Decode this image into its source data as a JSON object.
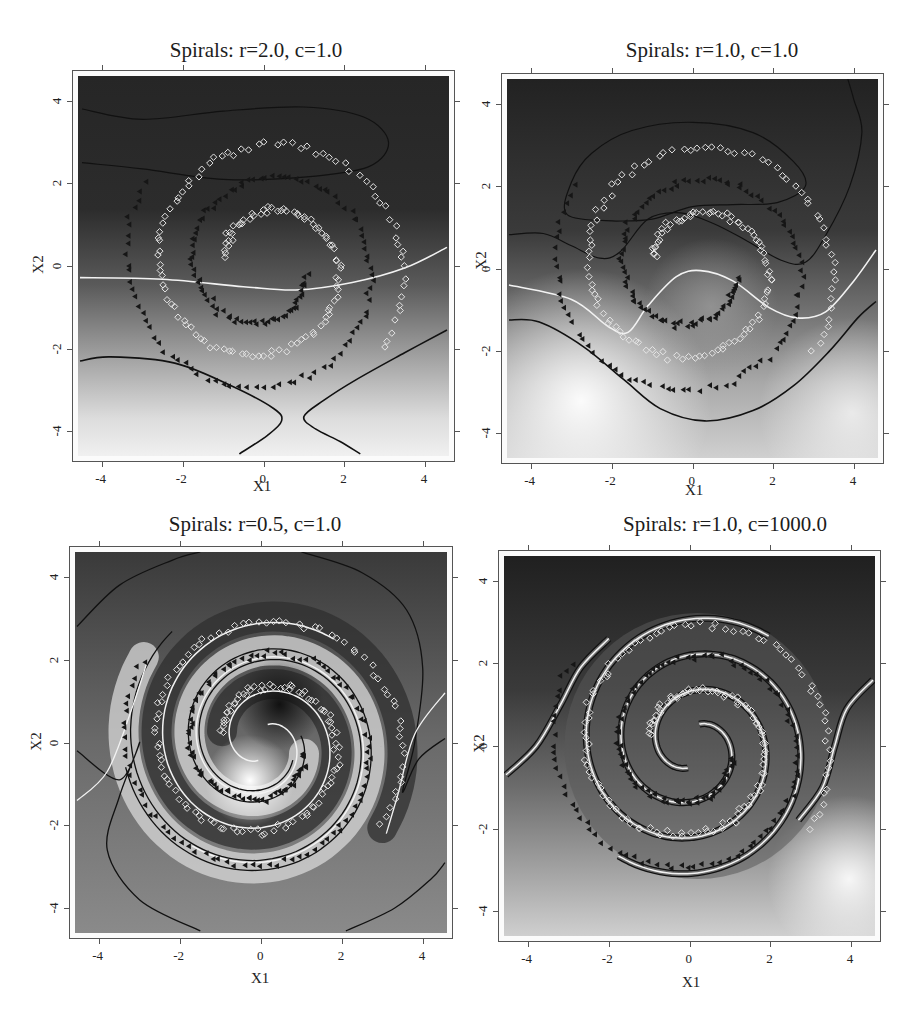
{
  "figure": {
    "layout": "2x2",
    "colors": {
      "surface_dark": "#232323",
      "surface_light": "#f4f4f4",
      "decision_contour": "#f2f2f2",
      "margin_contour": "#1a1a1a",
      "class1_marker": "#e6e6e6",
      "class2_marker": "#161616",
      "frame": "#555555"
    },
    "markers": {
      "class1": "hollow-diamond",
      "class2": "filled-left-triangle"
    }
  },
  "panels": [
    {
      "id": "p1",
      "title": "Spirals: r=2.0, c=1.0",
      "xlabel": "X1",
      "ylabel": "X2",
      "xticks": [
        "-4",
        "-2",
        "0",
        "2",
        "4"
      ],
      "yticks": [
        "-4",
        "-2",
        "0",
        "2",
        "4"
      ]
    },
    {
      "id": "p2",
      "title": "Spirals: r=1.0, c=1.0",
      "xlabel": "X1",
      "ylabel": "X2",
      "xticks": [
        "-4",
        "-2",
        "0",
        "2",
        "4"
      ],
      "yticks": [
        "-4",
        "-2",
        "0",
        "2",
        "4"
      ]
    },
    {
      "id": "p3",
      "title": "Spirals: r=0.5, c=1.0",
      "xlabel": "X1",
      "ylabel": "X2",
      "xticks": [
        "-4",
        "-2",
        "0",
        "2",
        "4"
      ],
      "yticks": [
        "-4",
        "-2",
        "0",
        "2",
        "4"
      ]
    },
    {
      "id": "p4",
      "title": "Spirals: r=1.0, c=1000.0",
      "xlabel": "X1",
      "ylabel": "X2",
      "xticks": [
        "-4",
        "-2",
        "0",
        "2",
        "4"
      ],
      "yticks": [
        "-4",
        "-2",
        "0",
        "2",
        "4"
      ]
    }
  ],
  "chart_data": [
    {
      "type": "contour",
      "title": "Spirals: r=2.0, c=1.0",
      "xlabel": "X1",
      "ylabel": "X2",
      "xlim": [
        -4.6,
        4.6
      ],
      "ylim": [
        -4.6,
        4.6
      ],
      "xticks": [
        -4,
        -2,
        0,
        2,
        4
      ],
      "yticks": [
        -4,
        -2,
        0,
        2,
        4
      ],
      "grid": false,
      "legend": null,
      "series": [
        {
          "name": "class 1 (spiral A)",
          "marker": "hollow-diamond",
          "color": "#e6e6e6",
          "spiral": {
            "r_start": 1.2,
            "r_end": 3.6,
            "theta_start_deg": 90,
            "theta_turn_deg": 360,
            "direction": "ccw"
          }
        },
        {
          "name": "class 2 (spiral B)",
          "marker": "filled-left-triangle",
          "color": "#161616",
          "spiral": {
            "r_start": 1.2,
            "r_end": 3.6,
            "theta_start_deg": 270,
            "theta_turn_deg": 360,
            "direction": "ccw"
          }
        }
      ],
      "contours": {
        "decision_f0": "nearly horizontal line from (-4.5,-0.25) dipping to (0.5,-0.55) rising to (4.5,0.45)",
        "margin_f_minus1": "two hyperbola-like arcs meeting near (0.7,-3.6)",
        "margin_f_plus1": "closed oval top region from x=-4.5 to 3.1, y 2.1 to 3.8"
      },
      "annotation": "smooth, underfits spiral; top dark, bottom light"
    },
    {
      "type": "contour",
      "title": "Spirals: r=1.0, c=1.0",
      "xlabel": "X1",
      "ylabel": "X2",
      "xlim": [
        -4.6,
        4.6
      ],
      "ylim": [
        -4.6,
        4.6
      ],
      "xticks": [
        -4,
        -2,
        0,
        2,
        4
      ],
      "yticks": [
        -4,
        -2,
        0,
        2,
        4
      ],
      "grid": false,
      "legend": null,
      "contours": {
        "decision_f0": "wavy line from (-4.5,-0.4) down to (-1.6,-1.55) up to (0.1,-0.05) down to (2.7,-1.2) up to (4.5,0.45)",
        "margin_f_minus1": "U-shaped curve from (-4.5,-1.25) down to (0.3,-3.7) up to (4.5,-0.8)",
        "margin_f_plus1": "arch region from (-4.5,0.8) over (0,3.6) to (4.1,4.6) with inner loop"
      },
      "annotation": "moderate fit; bottom-left lightest"
    },
    {
      "type": "contour",
      "title": "Spirals: r=0.5, c=1.0",
      "xlabel": "X1",
      "ylabel": "X2",
      "xlim": [
        -4.6,
        4.6
      ],
      "ylim": [
        -4.6,
        4.6
      ],
      "xticks": [
        -4,
        -2,
        0,
        2,
        4
      ],
      "yticks": [
        -4,
        -2,
        0,
        2,
        4
      ],
      "grid": false,
      "legend": null,
      "contours": {
        "decision_f0": "double spiral (yin-yang) separating the two classes",
        "margin_f_minus1": "spiral curve along class-2 points",
        "margin_f_plus1": "outer S-shaped contours at corners"
      },
      "annotation": "tight fit; dark blob near (0.5,0.8), light blob near (-0.3,-0.9)"
    },
    {
      "type": "contour",
      "title": "Spirals: r=1.0, c=1000.0",
      "xlabel": "X1",
      "ylabel": "X2",
      "xlim": [
        -4.6,
        4.6
      ],
      "ylim": [
        -4.6,
        4.6
      ],
      "xticks": [
        -4,
        -2,
        0,
        2,
        4
      ],
      "yticks": [
        -4,
        -2,
        0,
        2,
        4
      ],
      "grid": false,
      "legend": null,
      "contours": {
        "decision_f0": "spiral (white) between class bands, exits at (-4.5,-0.7) and (4.5,1.6)",
        "margin_f_minus1": "paired black spiral contours flanking the white decision boundary",
        "margin_f_plus1": "paired black spiral contours flanking the white decision boundary"
      },
      "annotation": "hard margin; narrow spiral bands, top dark, bottom light"
    }
  ]
}
